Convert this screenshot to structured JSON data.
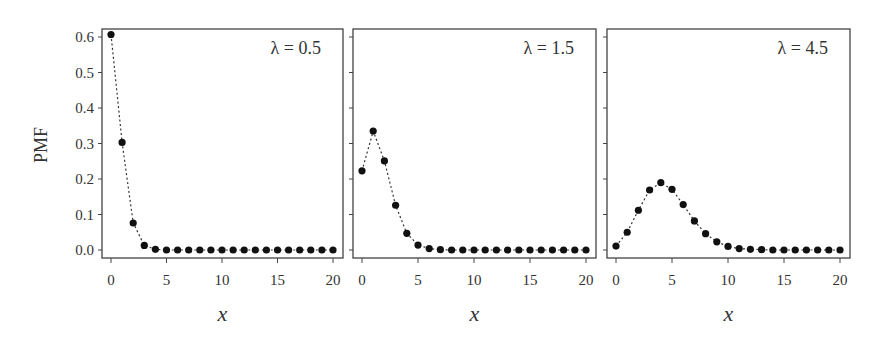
{
  "chart_data": [
    {
      "type": "line",
      "title": "",
      "annotation": "λ = 0.5",
      "lambda": 0.5,
      "xlabel": "x",
      "ylabel": "PMF",
      "x": [
        0,
        1,
        2,
        3,
        4,
        5,
        6,
        7,
        8,
        9,
        10,
        11,
        12,
        13,
        14,
        15,
        16,
        17,
        18,
        19,
        20
      ],
      "values": [
        0.607,
        0.303,
        0.076,
        0.013,
        0.002,
        0.0,
        0.0,
        0.0,
        0.0,
        0.0,
        0.0,
        0.0,
        0.0,
        0.0,
        0.0,
        0.0,
        0.0,
        0.0,
        0.0,
        0.0,
        0.0
      ],
      "xticks": [
        0,
        5,
        10,
        15,
        20
      ],
      "yticks": [
        "0.0",
        "0.1",
        "0.2",
        "0.3",
        "0.4",
        "0.5",
        "0.6"
      ],
      "ylim": [
        0,
        0.6
      ],
      "xlim": [
        0,
        20
      ],
      "line_style": "dotted",
      "marker": "filled-circle",
      "grid": false
    },
    {
      "type": "line",
      "title": "",
      "annotation": "λ = 1.5",
      "lambda": 1.5,
      "xlabel": "x",
      "ylabel": "",
      "x": [
        0,
        1,
        2,
        3,
        4,
        5,
        6,
        7,
        8,
        9,
        10,
        11,
        12,
        13,
        14,
        15,
        16,
        17,
        18,
        19,
        20
      ],
      "values": [
        0.223,
        0.335,
        0.251,
        0.126,
        0.047,
        0.014,
        0.004,
        0.001,
        0.0,
        0.0,
        0.0,
        0.0,
        0.0,
        0.0,
        0.0,
        0.0,
        0.0,
        0.0,
        0.0,
        0.0,
        0.0
      ],
      "xticks": [
        0,
        5,
        10,
        15,
        20
      ],
      "ylim": [
        0,
        0.6
      ],
      "xlim": [
        0,
        20
      ],
      "line_style": "dotted",
      "marker": "filled-circle",
      "grid": false
    },
    {
      "type": "line",
      "title": "",
      "annotation": "λ = 4.5",
      "lambda": 4.5,
      "xlabel": "x",
      "ylabel": "",
      "x": [
        0,
        1,
        2,
        3,
        4,
        5,
        6,
        7,
        8,
        9,
        10,
        11,
        12,
        13,
        14,
        15,
        16,
        17,
        18,
        19,
        20
      ],
      "values": [
        0.011,
        0.05,
        0.112,
        0.169,
        0.19,
        0.171,
        0.128,
        0.082,
        0.046,
        0.023,
        0.01,
        0.004,
        0.002,
        0.001,
        0.0,
        0.0,
        0.0,
        0.0,
        0.0,
        0.0,
        0.0
      ],
      "xticks": [
        0,
        5,
        10,
        15,
        20
      ],
      "ylim": [
        0,
        0.6
      ],
      "xlim": [
        0,
        20
      ],
      "line_style": "dotted",
      "marker": "filled-circle",
      "grid": false
    }
  ],
  "figure": {
    "ylabel": "PMF",
    "xlabel": "x",
    "panel_count": 3
  }
}
